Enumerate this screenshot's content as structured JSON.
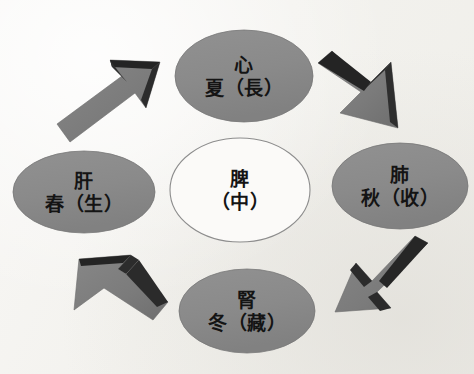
{
  "diagram": {
    "background_color": "#f4f3ef",
    "ellipse_fill": "#8b8b8b",
    "ellipse_stroke": "#6f6f6f",
    "center_fill": "#fbfbf9",
    "center_stroke": "#8d8d8d",
    "arrow_fill": "#7d7d7d",
    "arrow_bevel": "#262626",
    "text_color": "#141414",
    "nodes": [
      {
        "id": "heart",
        "position": "top",
        "organ": "心",
        "season": "夏（長）",
        "cx": 244,
        "cy": 76,
        "rx": 69,
        "ry": 46
      },
      {
        "id": "lung",
        "position": "right",
        "organ": "肺",
        "season": "秋（收）",
        "cx": 400,
        "cy": 186,
        "rx": 68,
        "ry": 43
      },
      {
        "id": "kidney",
        "position": "bottom",
        "organ": "腎",
        "season": "冬（藏）",
        "cx": 247,
        "cy": 311,
        "rx": 68,
        "ry": 42
      },
      {
        "id": "liver",
        "position": "left",
        "organ": "肝",
        "season": "春（生）",
        "cx": 84,
        "cy": 192,
        "rx": 71,
        "ry": 41
      }
    ],
    "center_node": {
      "id": "spleen",
      "position": "center",
      "organ": "脾",
      "season": "（中）",
      "cx": 240,
      "cy": 190,
      "rx": 70,
      "ry": 52
    },
    "arrows": [
      {
        "id": "liver-to-heart",
        "from": "肝",
        "to": "心",
        "direction": "up-right",
        "quadrant": "top-left"
      },
      {
        "id": "heart-to-lung",
        "from": "心",
        "to": "肺",
        "direction": "down-right",
        "quadrant": "top-right"
      },
      {
        "id": "lung-to-kidney",
        "from": "肺",
        "to": "腎",
        "direction": "down-left",
        "quadrant": "bottom-right"
      },
      {
        "id": "kidney-to-liver",
        "from": "腎",
        "to": "肝",
        "direction": "up-left",
        "quadrant": "bottom-left"
      }
    ]
  }
}
